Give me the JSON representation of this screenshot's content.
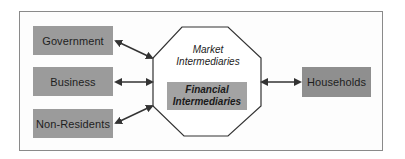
{
  "diagram": {
    "left_entities": [
      {
        "label": "Government"
      },
      {
        "label": "Business"
      },
      {
        "label": "Non-Residents"
      }
    ],
    "center": {
      "outer_label_line1": "Market",
      "outer_label_line2": "Intermediaries",
      "inner_label_line1": "Financial",
      "inner_label_line2": "Intermediaries"
    },
    "right_entity": {
      "label": "Households"
    },
    "colors": {
      "box_fill": "#9b9b9b",
      "frame_border": "#8a8a8a",
      "arrow": "#333333"
    }
  }
}
